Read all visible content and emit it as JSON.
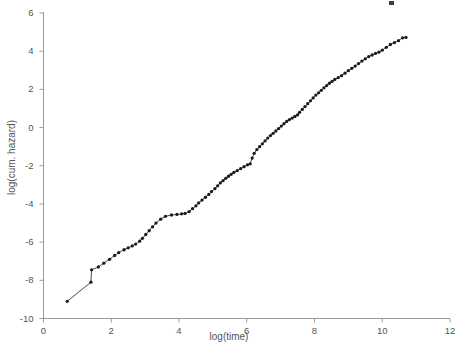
{
  "figure": {
    "background_color": "#ffffff",
    "axis_color": "#9a9a9a",
    "data_color": "#1a1a1a",
    "text_color": "#555555"
  },
  "chart_data": {
    "type": "line",
    "title": "",
    "subtitle": "",
    "xlabel": "log(time)",
    "ylabel": "log(cum. hazard)",
    "xlim": [
      0,
      12
    ],
    "ylim": [
      -10,
      6
    ],
    "xticks": [
      0,
      2,
      4,
      6,
      8,
      10,
      12
    ],
    "yticks": [
      -10,
      -8,
      -6,
      -4,
      -2,
      0,
      2,
      4,
      6
    ],
    "grid": false,
    "legend": null,
    "legend_position": "none",
    "marker": "point",
    "marker_size": 2,
    "line_style": "solid",
    "annotations": [],
    "series": [
      {
        "name": "log cumulative hazard",
        "x": [
          0.7,
          1.4,
          1.42,
          1.62,
          1.78,
          1.95,
          2.1,
          2.22,
          2.38,
          2.5,
          2.62,
          2.72,
          2.84,
          2.92,
          3.02,
          3.12,
          3.22,
          3.32,
          3.46,
          3.6,
          3.78,
          3.94,
          4.08,
          4.18,
          4.3,
          4.4,
          4.5,
          4.58,
          4.68,
          4.78,
          4.88,
          4.96,
          5.06,
          5.14,
          5.22,
          5.3,
          5.38,
          5.46,
          5.54,
          5.62,
          5.72,
          5.82,
          5.92,
          6.02,
          6.1,
          6.16,
          6.22,
          6.3,
          6.38,
          6.46,
          6.54,
          6.62,
          6.7,
          6.78,
          6.86,
          6.94,
          7.02,
          7.1,
          7.18,
          7.26,
          7.34,
          7.42,
          7.5,
          7.56,
          7.64,
          7.72,
          7.8,
          7.88,
          7.96,
          8.04,
          8.12,
          8.2,
          8.28,
          8.36,
          8.44,
          8.52,
          8.6,
          8.7,
          8.8,
          8.9,
          9.0,
          9.1,
          9.2,
          9.3,
          9.4,
          9.5,
          9.6,
          9.7,
          9.8,
          9.9,
          10.0,
          10.12,
          10.24,
          10.36,
          10.48,
          10.6,
          10.7
        ],
        "y": [
          -9.1,
          -8.1,
          -7.45,
          -7.3,
          -7.1,
          -6.9,
          -6.7,
          -6.55,
          -6.4,
          -6.3,
          -6.2,
          -6.1,
          -5.95,
          -5.8,
          -5.6,
          -5.4,
          -5.2,
          -5.0,
          -4.8,
          -4.65,
          -4.58,
          -4.55,
          -4.52,
          -4.5,
          -4.4,
          -4.25,
          -4.1,
          -3.95,
          -3.8,
          -3.65,
          -3.5,
          -3.35,
          -3.2,
          -3.05,
          -2.9,
          -2.78,
          -2.66,
          -2.55,
          -2.45,
          -2.35,
          -2.25,
          -2.15,
          -2.05,
          -1.95,
          -1.9,
          -1.6,
          -1.35,
          -1.15,
          -1.0,
          -0.85,
          -0.7,
          -0.55,
          -0.42,
          -0.3,
          -0.18,
          -0.05,
          0.08,
          0.2,
          0.32,
          0.42,
          0.5,
          0.58,
          0.66,
          0.8,
          0.95,
          1.1,
          1.25,
          1.4,
          1.55,
          1.7,
          1.82,
          1.95,
          2.08,
          2.2,
          2.32,
          2.42,
          2.52,
          2.62,
          2.72,
          2.85,
          2.98,
          3.1,
          3.22,
          3.35,
          3.48,
          3.6,
          3.72,
          3.8,
          3.88,
          3.95,
          4.05,
          4.2,
          4.35,
          4.45,
          4.55,
          4.7,
          4.72
        ]
      }
    ]
  }
}
